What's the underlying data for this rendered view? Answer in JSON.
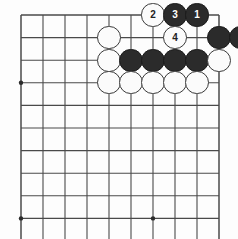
{
  "diagram": {
    "kind": "go-board-diagram",
    "board": {
      "visible_columns": 10,
      "visible_rows": 10,
      "line_color": "#4a4a4a",
      "background_color": "#fdfdfd",
      "star_point_color": "#2b2b2b",
      "origin_x": 21,
      "origin_y": 15,
      "spacing_x": 22,
      "spacing_y": 22.6,
      "star_points": [
        {
          "col": 0,
          "row": 3
        },
        {
          "col": 0,
          "row": 9
        },
        {
          "col": 6,
          "row": 9
        }
      ]
    },
    "stone_colors": {
      "black": "#2b2b2b",
      "white": "#fbfbfb",
      "black_label": "#ffffff",
      "white_label": "#222222"
    },
    "stones": [
      {
        "col": 6,
        "row": 0,
        "color": "white",
        "label": "2",
        "move": 2
      },
      {
        "col": 7,
        "row": 0,
        "color": "black",
        "label": "3",
        "move": 3
      },
      {
        "col": 8,
        "row": 0,
        "color": "black",
        "label": "1",
        "move": 1
      },
      {
        "col": 4,
        "row": 1,
        "color": "white",
        "label": ""
      },
      {
        "col": 7,
        "row": 1,
        "color": "white",
        "label": "4",
        "move": 4
      },
      {
        "col": 9,
        "row": 1,
        "color": "black",
        "label": ""
      },
      {
        "col": 10,
        "row": 1,
        "color": "black",
        "label": ""
      },
      {
        "col": 4,
        "row": 2,
        "color": "white",
        "label": ""
      },
      {
        "col": 5,
        "row": 2,
        "color": "black",
        "label": ""
      },
      {
        "col": 6,
        "row": 2,
        "color": "black",
        "label": ""
      },
      {
        "col": 7,
        "row": 2,
        "color": "black",
        "label": ""
      },
      {
        "col": 8,
        "row": 2,
        "color": "black",
        "label": ""
      },
      {
        "col": 9,
        "row": 2,
        "color": "white",
        "label": ""
      },
      {
        "col": 4,
        "row": 3,
        "color": "white",
        "label": ""
      },
      {
        "col": 5,
        "row": 3,
        "color": "white",
        "label": ""
      },
      {
        "col": 6,
        "row": 3,
        "color": "white",
        "label": ""
      },
      {
        "col": 7,
        "row": 3,
        "color": "white",
        "label": ""
      },
      {
        "col": 8,
        "row": 3,
        "color": "white",
        "label": ""
      }
    ],
    "move_numbers": [
      "1",
      "2",
      "3",
      "4"
    ]
  }
}
